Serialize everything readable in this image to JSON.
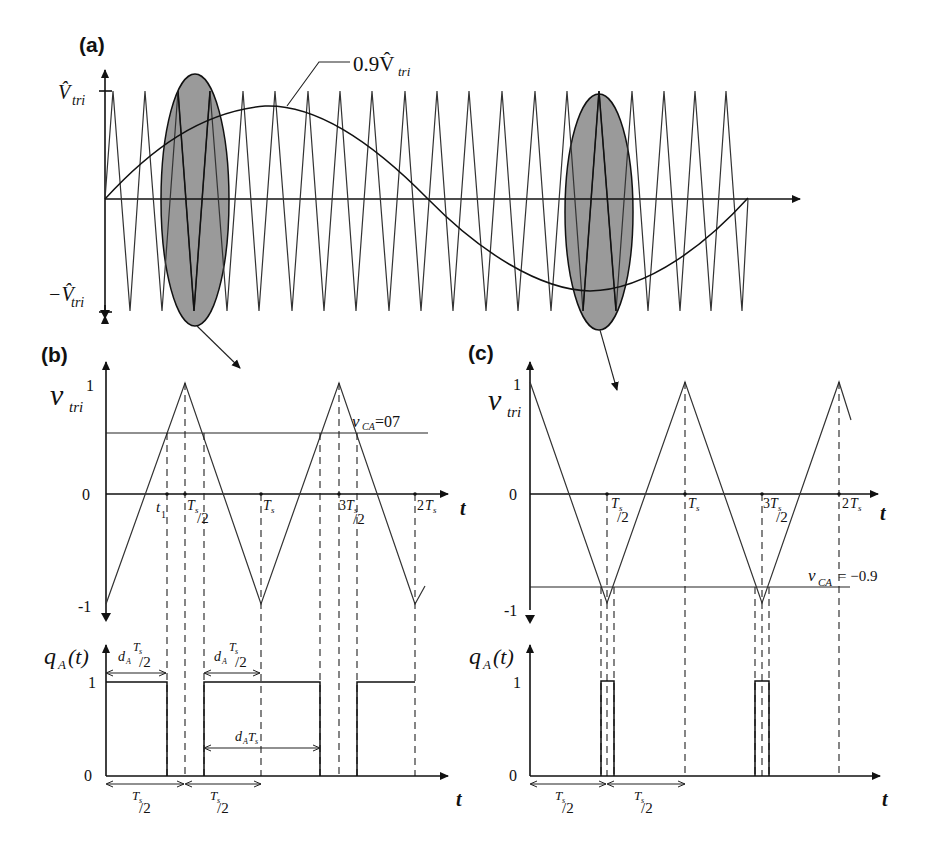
{
  "figure": {
    "panels": [
      {
        "id": "a",
        "label": "(a)",
        "y_labels": {
          "top": "V̂",
          "top_sub": "tri",
          "bottom": "−V̂",
          "bottom_sub": "tri"
        },
        "annotation": {
          "text": "0.9V̂",
          "sub": "tri"
        },
        "description": "Triangular carrier (about 20 periods) compared with sinusoidal reference of amplitude 0.9·V̂tri; two gray ellipses highlight regions near the sine peak crossing and trough that are zoomed in panels (b) and (c)"
      },
      {
        "id": "b",
        "label": "(b)",
        "y_axis_label": "v",
        "y_axis_sub": "tri",
        "y_ticks": [
          "1",
          "0",
          "-1"
        ],
        "reference_label": "v",
        "reference_sub": "CA",
        "reference_value": "=07",
        "x_ticks": [
          "t₁",
          "Ts/2",
          "Ts",
          "3Ts/2",
          "2Ts"
        ],
        "x_axis_label": "t",
        "q_axis_label": "q",
        "q_axis_sub": "A",
        "q_axis_arg": "(t)",
        "q_ticks": [
          "1",
          "0"
        ],
        "dimensions": [
          {
            "label": "dA Ts/2",
            "position": "first pulse"
          },
          {
            "label": "dA Ts/2",
            "position": "second pulse"
          },
          {
            "label": "dA Ts",
            "position": "mid"
          },
          {
            "label": "Ts/2",
            "position": "bottom-left"
          },
          {
            "label": "Ts/2",
            "position": "bottom-right"
          }
        ]
      },
      {
        "id": "c",
        "label": "(c)",
        "y_axis_label": "v",
        "y_axis_sub": "tri",
        "y_ticks": [
          "1",
          "0",
          "-1"
        ],
        "reference_label": "v",
        "reference_sub": "CA",
        "reference_value": "= −0.9",
        "x_ticks": [
          "Ts/2",
          "Ts",
          "3Ts/2",
          "2Ts"
        ],
        "x_axis_label": "t",
        "q_axis_label": "q",
        "q_axis_sub": "A",
        "q_axis_arg": "(t)",
        "q_ticks": [
          "1",
          "0"
        ],
        "dimensions": [
          {
            "label": "Ts/2",
            "position": "bottom-left"
          },
          {
            "label": "Ts/2",
            "position": "bottom-right"
          }
        ]
      }
    ],
    "labels": {
      "a": "(a)",
      "b": "(b)",
      "c": "(c)",
      "vhat": "V̂",
      "tri": "tri",
      "neg_vhat": "−V̂",
      "ann": "0.9V̂",
      "v": "v",
      "one": "1",
      "zero": "0",
      "neg_one": "-1",
      "vca_b_val": "=07",
      "vca_c_val": "= −0.9",
      "CA": "CA",
      "t": "t",
      "t1": "t",
      "t1_sub": "1",
      "Ts": "T",
      "s": "s",
      "half": "/2",
      "two": "2",
      "three": "3",
      "q": "q",
      "A": "A",
      "arg": "(t)",
      "d": "d"
    }
  }
}
